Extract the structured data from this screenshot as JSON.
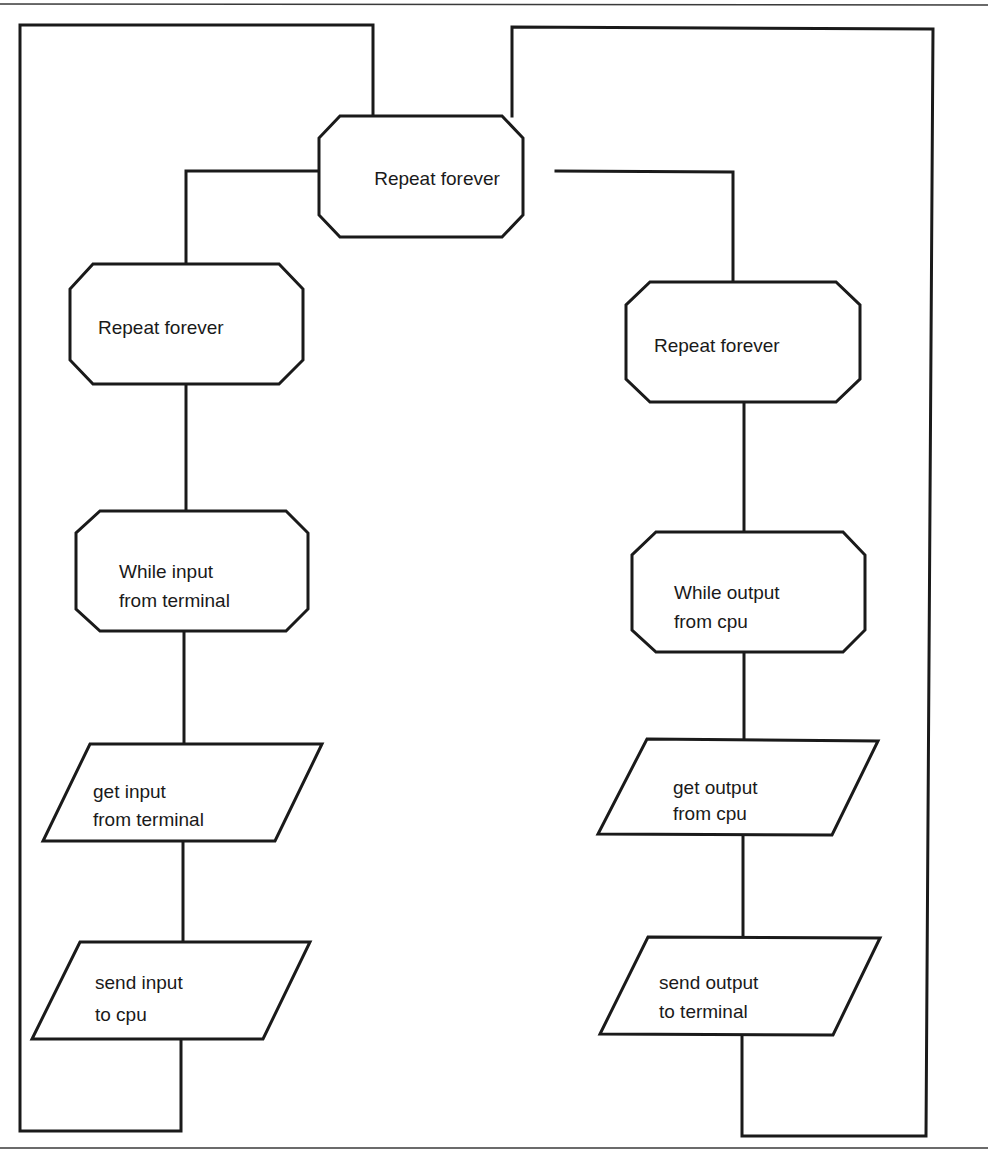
{
  "diagram": {
    "type": "flowchart",
    "colors": {
      "stroke": "#1a1a1a",
      "background": "#ffffff"
    },
    "nodes": {
      "top_loop": {
        "shape": "octagon",
        "lines": [
          "Repeat forever"
        ]
      },
      "left_loop": {
        "shape": "octagon",
        "lines": [
          "Repeat forever"
        ]
      },
      "right_loop": {
        "shape": "octagon",
        "lines": [
          "Repeat forever"
        ]
      },
      "left_while": {
        "shape": "octagon",
        "lines": [
          "While input",
          "from terminal"
        ]
      },
      "right_while": {
        "shape": "octagon",
        "lines": [
          "While output",
          "from cpu"
        ]
      },
      "left_get": {
        "shape": "parallelogram",
        "lines": [
          "get input",
          "from terminal"
        ]
      },
      "right_get": {
        "shape": "parallelogram",
        "lines": [
          "get output",
          "from cpu"
        ]
      },
      "left_send": {
        "shape": "parallelogram",
        "lines": [
          "send input",
          "to cpu"
        ]
      },
      "right_send": {
        "shape": "parallelogram",
        "lines": [
          "send output",
          "to terminal"
        ]
      }
    },
    "edges": [
      [
        "top_loop",
        "left_loop"
      ],
      [
        "top_loop",
        "right_loop"
      ],
      [
        "left_loop",
        "left_while"
      ],
      [
        "left_while",
        "left_get"
      ],
      [
        "left_get",
        "left_send"
      ],
      [
        "left_send",
        "top_loop"
      ],
      [
        "right_loop",
        "right_while"
      ],
      [
        "right_while",
        "right_get"
      ],
      [
        "right_get",
        "right_send"
      ],
      [
        "right_send",
        "top_loop"
      ]
    ]
  }
}
